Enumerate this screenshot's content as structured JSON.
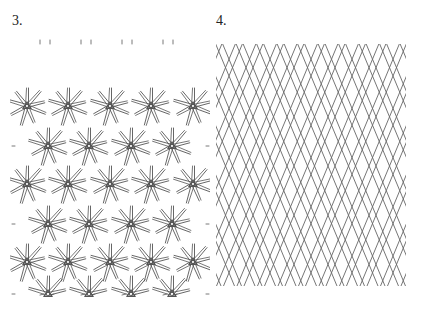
{
  "figure": {
    "panels": [
      {
        "label": "3.",
        "pattern": "star-burst lattice",
        "rows": 7,
        "stroke_color": "#555555"
      },
      {
        "label": "4.",
        "pattern": "diamond diagonal lattice",
        "stroke_color": "#666666"
      }
    ]
  }
}
